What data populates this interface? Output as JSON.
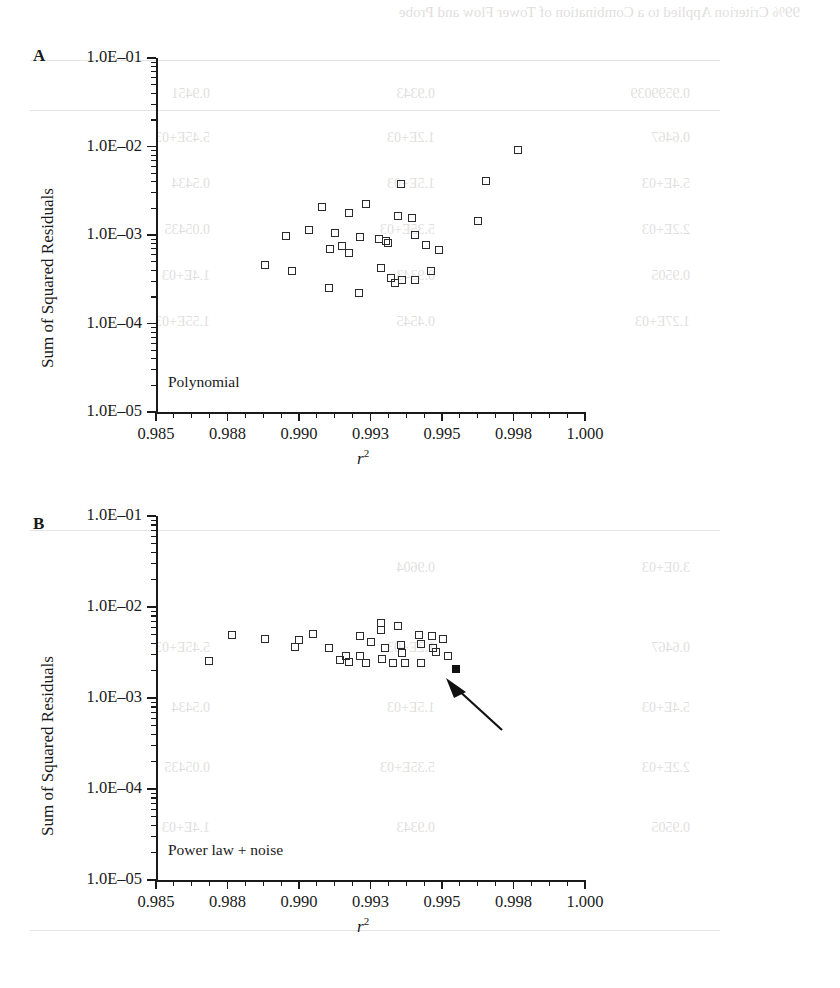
{
  "page": {
    "background_color": "#ffffff",
    "ink_color": "#1a1a1a",
    "bleed_color": "#4a4438",
    "show_through_lines": [
      "99% Criterion Applied to a Combination of Tower Flow and Probe",
      "0.9599039",
      "0.9343",
      "0.9451",
      "0.6467",
      "1.2E+03",
      "5.45E+03",
      "5.4E+03",
      "1.5E+03",
      "0.5434",
      "2.2E+03",
      "5.35E+03",
      "0.05435",
      "0.9505",
      "0.9343",
      "1.4E+03",
      "1.27E+03",
      "0.4545",
      "1.55E+03",
      "3.0E+03",
      "0.9604",
      "5.45E+03"
    ]
  },
  "figure": {
    "marker": {
      "open_symbol": "open-square",
      "filled_symbol": "filled-square",
      "size_px": 8
    },
    "annotation": {
      "type": "arrow",
      "points_to": "filled-square-marker",
      "panel": "B"
    }
  },
  "chart_data": [
    {
      "panel": "A",
      "panel_letter": "A",
      "type": "scatter",
      "title": "",
      "series_label": "Polynomial",
      "xlabel": "r2",
      "xlabel_display": "r",
      "xlabel_superscript": "2",
      "ylabel": "Sum of Squared Residuals",
      "yscale": "log",
      "ylim": [
        1e-05,
        0.1
      ],
      "ytick_labels": [
        "1.0E–01",
        "1.0E–02",
        "1.0E–03",
        "1.0E–04",
        "1.0E–05"
      ],
      "ytick_values": [
        0.1,
        0.01,
        0.001,
        0.0001,
        1e-05
      ],
      "xlim": [
        0.985,
        1.0
      ],
      "xtick_labels": [
        "0.985",
        "0.988",
        "0.990",
        "0.993",
        "0.995",
        "0.998",
        "1.000"
      ],
      "xtick_values": [
        0.985,
        0.9875,
        0.99,
        0.9925,
        0.995,
        0.9975,
        1.0
      ],
      "grid": false,
      "legend": "none",
      "points": [
        {
          "x": 0.99765,
          "y": 0.0091,
          "fill": "open"
        },
        {
          "x": 0.99355,
          "y": 0.0038,
          "fill": "open"
        },
        {
          "x": 0.99655,
          "y": 0.0041,
          "fill": "open"
        },
        {
          "x": 0.99235,
          "y": 0.00225,
          "fill": "open"
        },
        {
          "x": 0.9908,
          "y": 0.00205,
          "fill": "open"
        },
        {
          "x": 0.99175,
          "y": 0.00175,
          "fill": "open"
        },
        {
          "x": 0.99345,
          "y": 0.00165,
          "fill": "open"
        },
        {
          "x": 0.99395,
          "y": 0.00155,
          "fill": "open"
        },
        {
          "x": 0.99625,
          "y": 0.00145,
          "fill": "open"
        },
        {
          "x": 0.99035,
          "y": 0.00115,
          "fill": "open"
        },
        {
          "x": 0.99125,
          "y": 0.00105,
          "fill": "open"
        },
        {
          "x": 0.99405,
          "y": 0.001,
          "fill": "open"
        },
        {
          "x": 0.98955,
          "y": 0.00097,
          "fill": "open"
        },
        {
          "x": 0.99215,
          "y": 0.00094,
          "fill": "open"
        },
        {
          "x": 0.9928,
          "y": 0.0009,
          "fill": "open"
        },
        {
          "x": 0.99305,
          "y": 0.00086,
          "fill": "open"
        },
        {
          "x": 0.9931,
          "y": 0.00082,
          "fill": "open"
        },
        {
          "x": 0.9915,
          "y": 0.00076,
          "fill": "open"
        },
        {
          "x": 0.99445,
          "y": 0.00077,
          "fill": "open"
        },
        {
          "x": 0.9911,
          "y": 0.0007,
          "fill": "open"
        },
        {
          "x": 0.9949,
          "y": 0.00068,
          "fill": "open"
        },
        {
          "x": 0.99175,
          "y": 0.00062,
          "fill": "open"
        },
        {
          "x": 0.9888,
          "y": 0.00046,
          "fill": "open"
        },
        {
          "x": 0.99285,
          "y": 0.00042,
          "fill": "open"
        },
        {
          "x": 0.98975,
          "y": 0.00039,
          "fill": "open"
        },
        {
          "x": 0.9946,
          "y": 0.00039,
          "fill": "open"
        },
        {
          "x": 0.9932,
          "y": 0.00033,
          "fill": "open"
        },
        {
          "x": 0.9936,
          "y": 0.00031,
          "fill": "open"
        },
        {
          "x": 0.99405,
          "y": 0.00031,
          "fill": "open"
        },
        {
          "x": 0.99335,
          "y": 0.00029,
          "fill": "open"
        },
        {
          "x": 0.99105,
          "y": 0.00025,
          "fill": "open"
        },
        {
          "x": 0.9921,
          "y": 0.00022,
          "fill": "open"
        }
      ]
    },
    {
      "panel": "B",
      "panel_letter": "B",
      "type": "scatter",
      "title": "",
      "series_label": "Power law + noise",
      "xlabel": "r2",
      "xlabel_display": "r",
      "xlabel_superscript": "2",
      "ylabel": "Sum of Squared Residuals",
      "yscale": "log",
      "ylim": [
        1e-05,
        0.1
      ],
      "ytick_labels": [
        "1.0E–01",
        "1.0E–02",
        "1.0E–03",
        "1.0E–04",
        "1.0E–05"
      ],
      "ytick_values": [
        0.1,
        0.01,
        0.001,
        0.0001,
        1e-05
      ],
      "xlim": [
        0.985,
        1.0
      ],
      "xtick_labels": [
        "0.985",
        "0.988",
        "0.990",
        "0.993",
        "0.995",
        "0.998",
        "1.000"
      ],
      "xtick_values": [
        0.985,
        0.9875,
        0.99,
        0.9925,
        0.995,
        0.9975,
        1.0
      ],
      "grid": false,
      "legend": "none",
      "points": [
        {
          "x": 0.98685,
          "y": 0.00255,
          "fill": "open"
        },
        {
          "x": 0.98765,
          "y": 0.0049,
          "fill": "open"
        },
        {
          "x": 0.9888,
          "y": 0.0045,
          "fill": "open"
        },
        {
          "x": 0.99,
          "y": 0.0043,
          "fill": "open"
        },
        {
          "x": 0.98985,
          "y": 0.0036,
          "fill": "open"
        },
        {
          "x": 0.9905,
          "y": 0.0051,
          "fill": "open"
        },
        {
          "x": 0.99105,
          "y": 0.0035,
          "fill": "open"
        },
        {
          "x": 0.99165,
          "y": 0.0029,
          "fill": "open"
        },
        {
          "x": 0.99145,
          "y": 0.0026,
          "fill": "open"
        },
        {
          "x": 0.99215,
          "y": 0.0048,
          "fill": "open"
        },
        {
          "x": 0.9925,
          "y": 0.0041,
          "fill": "open"
        },
        {
          "x": 0.99215,
          "y": 0.0029,
          "fill": "open"
        },
        {
          "x": 0.99175,
          "y": 0.0025,
          "fill": "open"
        },
        {
          "x": 0.99235,
          "y": 0.0024,
          "fill": "open"
        },
        {
          "x": 0.9929,
          "y": 0.0027,
          "fill": "open"
        },
        {
          "x": 0.99285,
          "y": 0.0066,
          "fill": "open"
        },
        {
          "x": 0.99285,
          "y": 0.0056,
          "fill": "open"
        },
        {
          "x": 0.993,
          "y": 0.0035,
          "fill": "open"
        },
        {
          "x": 0.9933,
          "y": 0.0024,
          "fill": "open"
        },
        {
          "x": 0.99345,
          "y": 0.0062,
          "fill": "open"
        },
        {
          "x": 0.99355,
          "y": 0.0038,
          "fill": "open"
        },
        {
          "x": 0.9936,
          "y": 0.0031,
          "fill": "open"
        },
        {
          "x": 0.9937,
          "y": 0.0024,
          "fill": "open"
        },
        {
          "x": 0.9942,
          "y": 0.0049,
          "fill": "open"
        },
        {
          "x": 0.99425,
          "y": 0.0039,
          "fill": "open"
        },
        {
          "x": 0.99425,
          "y": 0.0024,
          "fill": "open"
        },
        {
          "x": 0.99465,
          "y": 0.0048,
          "fill": "open"
        },
        {
          "x": 0.9947,
          "y": 0.0035,
          "fill": "open"
        },
        {
          "x": 0.9948,
          "y": 0.0032,
          "fill": "open"
        },
        {
          "x": 0.99505,
          "y": 0.0044,
          "fill": "open"
        },
        {
          "x": 0.9952,
          "y": 0.0029,
          "fill": "open"
        },
        {
          "x": 0.9955,
          "y": 0.0021,
          "fill": "filled"
        }
      ]
    }
  ]
}
